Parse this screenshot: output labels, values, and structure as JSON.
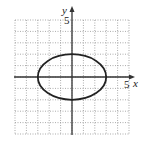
{
  "chart_data": {
    "type": "line",
    "title": "",
    "equation": "x^2/9 + y^2/4 = 1",
    "curve": "ellipse",
    "center": [
      0,
      0
    ],
    "semi_axis_x": 3,
    "semi_axis_y": 2,
    "xlabel": "x",
    "ylabel": "y",
    "xlim": [
      -5,
      5
    ],
    "ylim": [
      -5,
      5
    ],
    "grid": true,
    "grid_step": 1,
    "tick_labels": {
      "x": "5",
      "y": "5"
    },
    "x": [
      -3,
      -2,
      -1,
      0,
      1,
      2,
      3
    ],
    "series": [
      {
        "name": "upper",
        "values": [
          0,
          1.49,
          1.89,
          2,
          1.89,
          1.49,
          0
        ]
      },
      {
        "name": "lower",
        "values": [
          0,
          -1.49,
          -1.89,
          -2,
          -1.89,
          -1.49,
          0
        ]
      }
    ]
  },
  "labels": {
    "x_axis": "x",
    "y_axis": "y",
    "x_tick": "5",
    "y_tick": "5"
  },
  "colors": {
    "curve": "#222222",
    "axis": "#333333",
    "grid": "#888888"
  }
}
